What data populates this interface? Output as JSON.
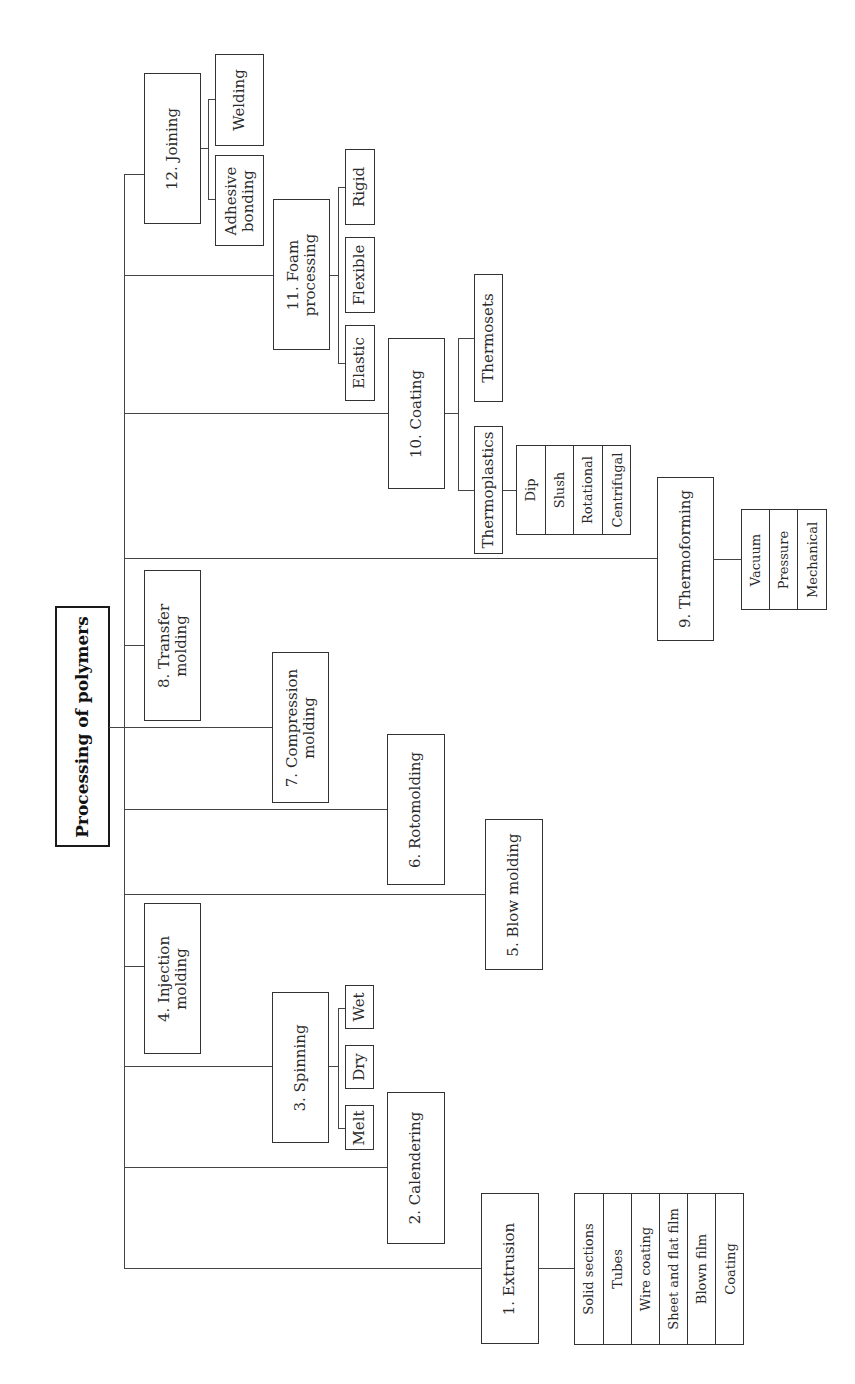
{
  "title": "Processing of polymers",
  "methods": [
    {
      "label": "1. Extrusion",
      "children": [
        "Solid sections",
        "Tubes",
        "Wire coating",
        "Sheet and flat film",
        "Blown film",
        "Coating"
      ]
    },
    {
      "label": "2. Calendering"
    },
    {
      "label": "3. Spinning",
      "children": [
        "Melt",
        "Dry",
        "Wet"
      ]
    },
    {
      "label": "4. Injection\nmolding"
    },
    {
      "label": "5. Blow molding"
    },
    {
      "label": "6. Rotomolding"
    },
    {
      "label": "7. Compression\nmolding"
    },
    {
      "label": "8. Transfer\nmolding"
    },
    {
      "label": "9. Thermoforming",
      "children": [
        "Vacuum",
        "Pressure",
        "Mechanical"
      ]
    },
    {
      "label": "10. Coating",
      "children": [
        {
          "label": "Thermoplastics",
          "children": [
            "Dip",
            "Slush",
            "Rotational",
            "Centrifugal"
          ]
        },
        {
          "label": "Thermosets"
        }
      ]
    },
    {
      "label": "11. Foam\nprocessing",
      "children": [
        "Elastic",
        "Flexible",
        "Rigid"
      ]
    },
    {
      "label": "12. Joining",
      "children": [
        "Adhesive\nbonding",
        "Welding"
      ]
    }
  ],
  "colors": {
    "line": "#444444",
    "border": "#333333",
    "background": "#ffffff"
  }
}
